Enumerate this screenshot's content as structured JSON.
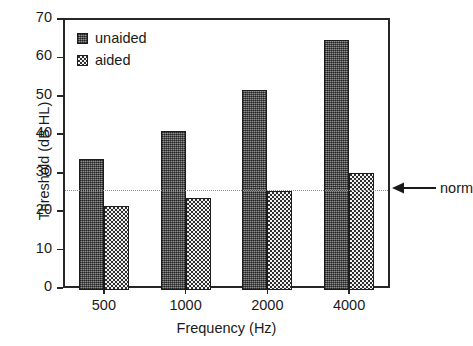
{
  "chart_data": {
    "type": "bar",
    "title": "",
    "subtitle": "",
    "xlabel": "Frequency (Hz)",
    "ylabel": "Threshold (dB HL)",
    "categories": [
      "500",
      "1000",
      "2000",
      "4000"
    ],
    "xtick_labels": [
      "500",
      "1000",
      "2000",
      "4000"
    ],
    "ytick_labels": [
      "0",
      "10",
      "20",
      "30",
      "40",
      "50",
      "60",
      "70"
    ],
    "ytick_values": [
      0,
      10,
      20,
      30,
      40,
      50,
      60,
      70
    ],
    "ylim": [
      0,
      70
    ],
    "grid": false,
    "legend_position": "upper-left-inside",
    "series": [
      {
        "name": "unaided",
        "fill": "stipple-dark-gray",
        "color": "#5a5a5a",
        "values": [
          34,
          41.5,
          52,
          65
        ]
      },
      {
        "name": "aided",
        "fill": "checkerboard",
        "color": "#3a3a3a",
        "values": [
          21.8,
          24,
          25.8,
          30.5
        ]
      }
    ],
    "annotations": [
      {
        "name": "norm",
        "label": "norm",
        "type": "horizontal-reference-line-with-arrow",
        "value": 26,
        "line_style": "dotted",
        "line_color": "#8f8f8f"
      }
    ]
  },
  "legend": {
    "items": [
      {
        "label": "unaided"
      },
      {
        "label": "aided"
      }
    ]
  },
  "axes": {
    "x_title": "Frequency (Hz)",
    "y_title": "Threshold (dB HL)"
  },
  "colors": {
    "axis": "#262626",
    "unaided": "#5a5a5a",
    "aided": "#3a3a3a",
    "norm_line": "#8f8f8f",
    "background": "#ffffff"
  }
}
